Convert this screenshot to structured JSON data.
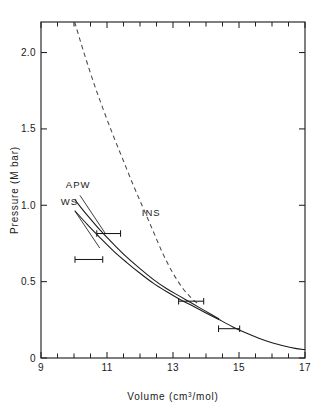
{
  "figure": {
    "background_color": "#ffffff",
    "line_color": "#1a1a1a"
  },
  "chart_data": {
    "type": "line",
    "title": "",
    "xlabel": "Volume (cm3/mol)",
    "xlabel_main": "Volume (cm",
    "xlabel_sup": "3",
    "xlabel_tail": "/mol)",
    "ylabel": "Pressure (M bar)",
    "xlim": [
      9,
      17
    ],
    "ylim": [
      0,
      2.2
    ],
    "xticks": [
      9,
      11,
      13,
      15,
      17
    ],
    "xtick_labels": [
      "9",
      "11",
      "13",
      "15",
      "17"
    ],
    "xminor_step": 0.5,
    "yticks": [
      0,
      0.5,
      1.0,
      1.5,
      2.0
    ],
    "ytick_labels": [
      "0",
      "0.5",
      "1.0",
      "1.5",
      "2.0"
    ],
    "grid": false,
    "legend_position": "inline-annotations",
    "series": [
      {
        "name": "INS",
        "style": "dashed",
        "label": "INS",
        "label_x": 12.05,
        "label_y": 0.93,
        "points": [
          [
            10.02,
            2.2
          ],
          [
            10.3,
            2.0
          ],
          [
            10.6,
            1.8
          ],
          [
            10.9,
            1.62
          ],
          [
            11.2,
            1.45
          ],
          [
            11.5,
            1.29
          ],
          [
            11.8,
            1.13
          ],
          [
            12.1,
            0.98
          ],
          [
            12.4,
            0.83
          ],
          [
            12.7,
            0.68
          ],
          [
            13.0,
            0.555
          ],
          [
            13.3,
            0.455
          ],
          [
            13.55,
            0.395
          ],
          [
            13.75,
            0.355
          ]
        ]
      },
      {
        "name": "APW",
        "style": "solid",
        "label": "APW",
        "label_x": 9.75,
        "label_y": 1.11,
        "points": [
          [
            10.03,
            1.035
          ],
          [
            10.4,
            0.935
          ],
          [
            10.8,
            0.835
          ],
          [
            11.2,
            0.745
          ],
          [
            11.6,
            0.66
          ],
          [
            12.0,
            0.585
          ],
          [
            12.4,
            0.515
          ],
          [
            12.8,
            0.455
          ],
          [
            13.2,
            0.405
          ],
          [
            13.6,
            0.355
          ],
          [
            14.0,
            0.305
          ],
          [
            14.4,
            0.255
          ]
        ]
      },
      {
        "name": "WS",
        "style": "solid",
        "label": "WS",
        "label_x": 9.6,
        "label_y": 1.005,
        "points": [
          [
            10.02,
            0.965
          ],
          [
            10.4,
            0.875
          ],
          [
            10.8,
            0.785
          ],
          [
            11.2,
            0.7
          ],
          [
            11.6,
            0.625
          ],
          [
            12.0,
            0.555
          ],
          [
            12.4,
            0.49
          ],
          [
            12.8,
            0.435
          ],
          [
            13.2,
            0.385
          ],
          [
            13.6,
            0.34
          ],
          [
            14.0,
            0.295
          ],
          [
            14.4,
            0.25
          ]
        ]
      },
      {
        "name": "experimental-curve",
        "style": "solid",
        "label": "",
        "points": [
          [
            14.4,
            0.252
          ],
          [
            14.8,
            0.205
          ],
          [
            15.2,
            0.165
          ],
          [
            15.6,
            0.13
          ],
          [
            16.0,
            0.1
          ],
          [
            16.4,
            0.077
          ],
          [
            16.7,
            0.063
          ],
          [
            17.0,
            0.055
          ]
        ]
      }
    ],
    "error_bars": [
      {
        "x": 11.05,
        "y": 0.815,
        "xerr": 0.36
      },
      {
        "x": 10.45,
        "y": 0.645,
        "xerr": 0.42
      },
      {
        "x": 13.55,
        "y": 0.372,
        "xerr": 0.38
      },
      {
        "x": 14.7,
        "y": 0.192,
        "xerr": 0.32
      }
    ],
    "annotations": [
      {
        "text": "INS",
        "x": 12.05,
        "y": 0.93
      },
      {
        "text": "APW",
        "x": 9.75,
        "y": 1.11
      },
      {
        "text": "WS",
        "x": 9.6,
        "y": 1.005
      }
    ]
  }
}
